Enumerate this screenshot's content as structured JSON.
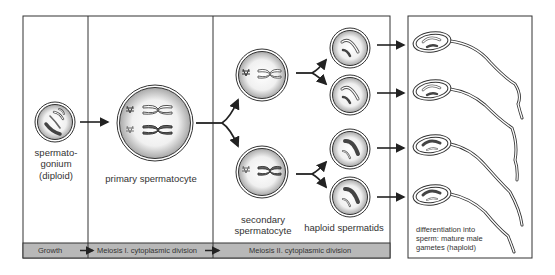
{
  "diagram": {
    "colors": {
      "line": "#333333",
      "bar_fill": "#b8b8b8",
      "cell_fill": "#d9d9d9",
      "chromosome_dark": "#555555"
    },
    "stages": [
      {
        "id": "spermatogonium",
        "label_lines": [
          "spermato-",
          "gonium",
          "(diploid)"
        ]
      },
      {
        "id": "primary",
        "label": "primary spermatocyte"
      },
      {
        "id": "secondary",
        "label_lines": [
          "secondary",
          "spermatocyte"
        ]
      },
      {
        "id": "spermatids",
        "label": "haploid spermatids"
      },
      {
        "id": "sperm",
        "label_lines": [
          "differentiation into",
          "sperm: mature male",
          "gametes (haploid)"
        ]
      }
    ],
    "phase_bar": {
      "items": [
        {
          "label": "Growth"
        },
        {
          "label": "Meiosis I. cytoplasmic division"
        },
        {
          "label": "Meiosis II. cytoplasmic division"
        }
      ]
    },
    "counts": {
      "spermatogonia": 1,
      "primary_spermatocytes": 1,
      "secondary_spermatocytes": 2,
      "spermatids": 4,
      "sperm": 4
    }
  }
}
